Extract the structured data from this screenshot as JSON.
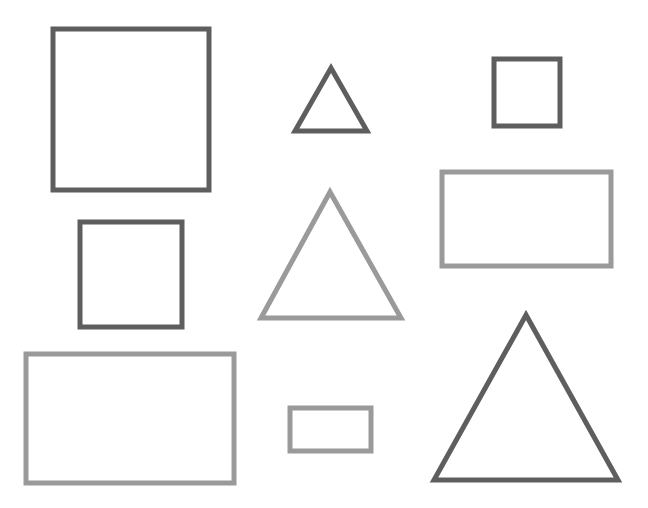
{
  "canvas": {
    "width": 648,
    "height": 508,
    "background": "#ffffff"
  },
  "colors": {
    "dark": "#5e5e5e",
    "light": "#9a9a9a"
  },
  "stroke_width": 5,
  "shapes": [
    {
      "id": "square-large-dark",
      "type": "rect",
      "tone": "dark",
      "x": 53,
      "y": 29,
      "w": 156,
      "h": 161
    },
    {
      "id": "triangle-small-dark",
      "type": "triangle",
      "tone": "dark",
      "points": [
        [
          331,
          68
        ],
        [
          295,
          131
        ],
        [
          367,
          131
        ]
      ]
    },
    {
      "id": "square-small-dark",
      "type": "rect",
      "tone": "dark",
      "x": 494,
      "y": 59,
      "w": 66,
      "h": 67
    },
    {
      "id": "square-medium-dark",
      "type": "rect",
      "tone": "dark",
      "x": 80,
      "y": 222,
      "w": 102,
      "h": 105
    },
    {
      "id": "triangle-medium-light",
      "type": "triangle",
      "tone": "light",
      "points": [
        [
          330,
          192
        ],
        [
          261,
          318
        ],
        [
          401,
          318
        ]
      ]
    },
    {
      "id": "rectangle-medium-light",
      "type": "rect",
      "tone": "light",
      "x": 442,
      "y": 172,
      "w": 169,
      "h": 94
    },
    {
      "id": "rectangle-large-light",
      "type": "rect",
      "tone": "light",
      "x": 26,
      "y": 354,
      "w": 208,
      "h": 129
    },
    {
      "id": "rectangle-small-light",
      "type": "rect",
      "tone": "light",
      "x": 290,
      "y": 408,
      "w": 81,
      "h": 43
    },
    {
      "id": "triangle-large-dark",
      "type": "triangle",
      "tone": "dark",
      "points": [
        [
          526,
          315
        ],
        [
          434,
          480
        ],
        [
          618,
          480
        ]
      ]
    }
  ]
}
